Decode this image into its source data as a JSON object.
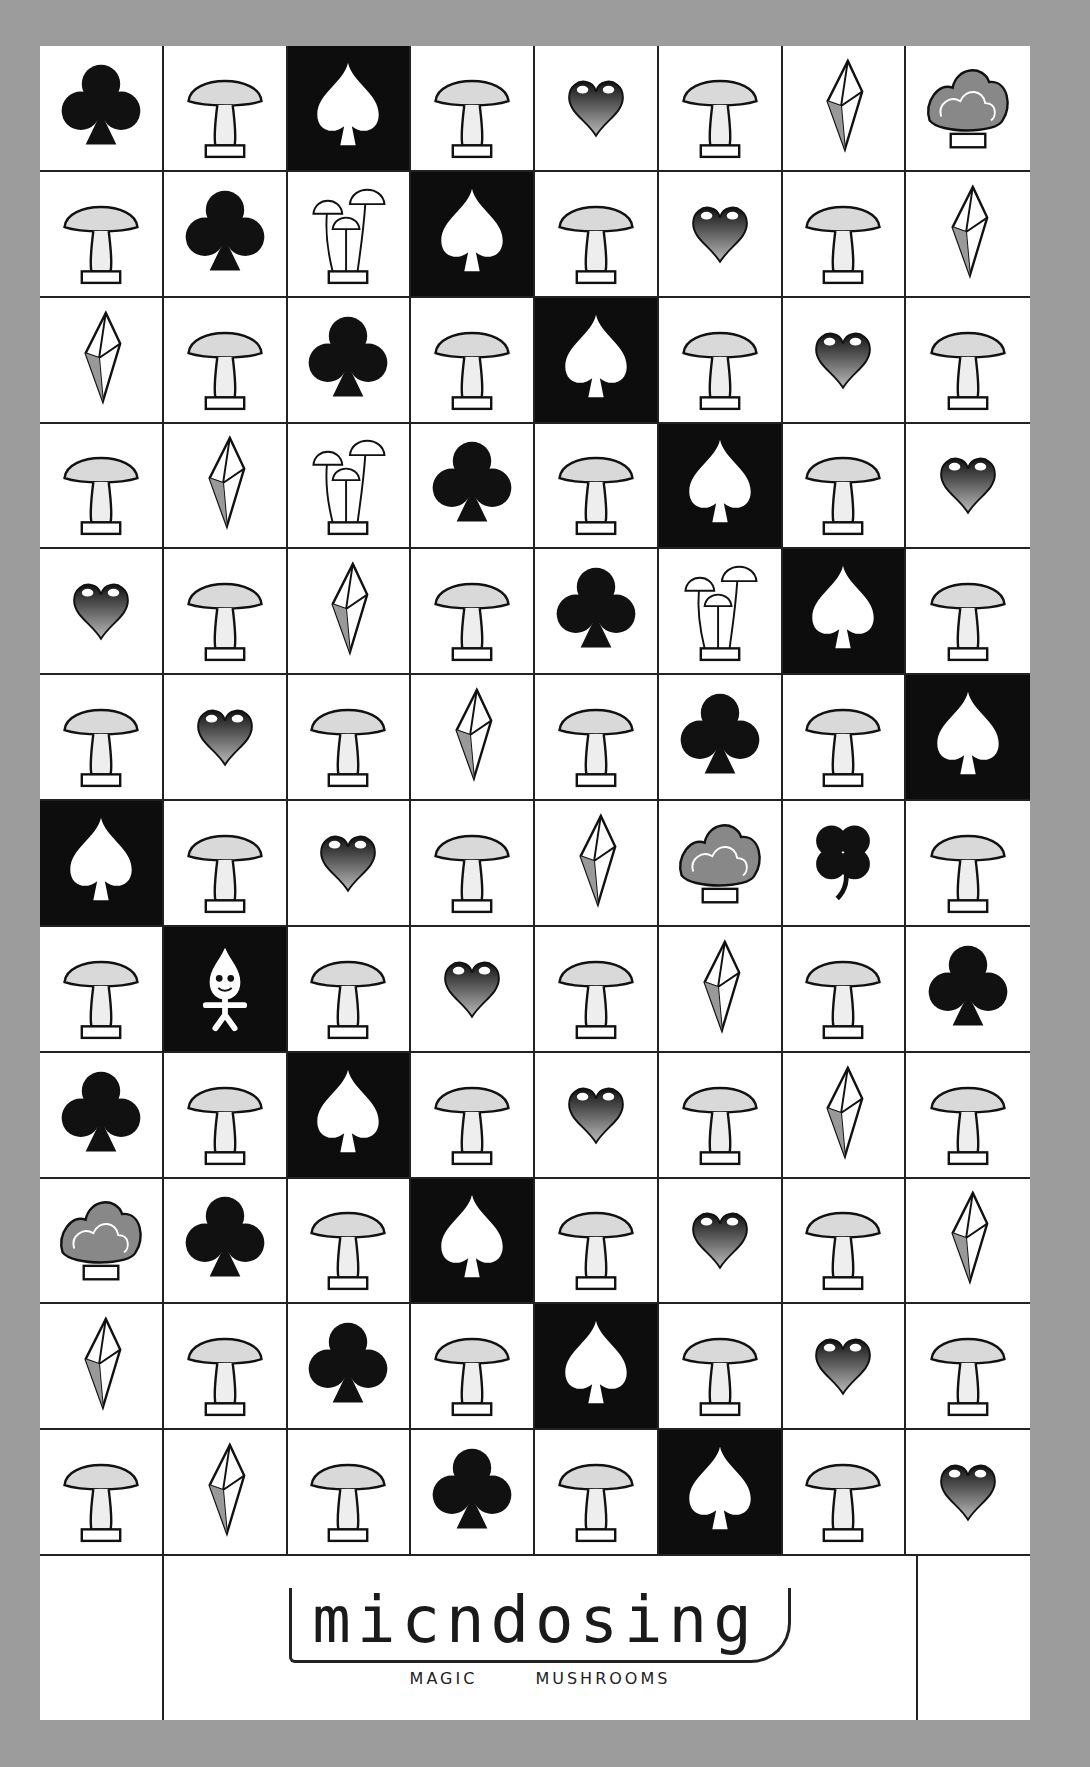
{
  "artwork": {
    "title": "micndosing",
    "subtitle": "MAGIC MUSHROOMS",
    "colors": {
      "background": "#9c9c9c",
      "paper": "#ffffff",
      "ink": "#111111",
      "shade": "#d9d9d9"
    },
    "grid": {
      "columns": 8,
      "rows": [
        [
          "club",
          "mushroom",
          "spade",
          "mushroom",
          "heart",
          "mushroom",
          "crystal",
          "coral"
        ],
        [
          "mushroom",
          "club",
          "mushroom-cluster",
          "spade",
          "mushroom",
          "heart",
          "mushroom",
          "crystal"
        ],
        [
          "crystal",
          "mushroom",
          "club",
          "mushroom",
          "spade",
          "mushroom",
          "heart",
          "mushroom"
        ],
        [
          "mushroom",
          "crystal",
          "mushroom-cluster",
          "club",
          "mushroom",
          "spade",
          "mushroom",
          "heart"
        ],
        [
          "heart",
          "mushroom",
          "crystal",
          "mushroom",
          "club",
          "mushroom-cluster",
          "spade",
          "mushroom"
        ],
        [
          "mushroom",
          "heart",
          "mushroom",
          "crystal",
          "mushroom",
          "club",
          "mushroom",
          "spade"
        ],
        [
          "spade",
          "mushroom",
          "heart",
          "mushroom",
          "crystal",
          "coral",
          "clover",
          "mushroom"
        ],
        [
          "mushroom",
          "doll",
          "mushroom",
          "heart",
          "mushroom",
          "crystal",
          "mushroom",
          "club"
        ],
        [
          "club",
          "mushroom",
          "spade",
          "mushroom",
          "heart",
          "mushroom",
          "crystal",
          "mushroom"
        ],
        [
          "coral",
          "club",
          "mushroom",
          "spade",
          "mushroom",
          "heart",
          "mushroom",
          "crystal"
        ],
        [
          "crystal",
          "mushroom",
          "club",
          "mushroom",
          "spade",
          "mushroom",
          "heart",
          "mushroom"
        ],
        [
          "mushroom",
          "crystal",
          "mushroom",
          "club",
          "mushroom",
          "spade",
          "mushroom",
          "heart"
        ]
      ]
    },
    "footer": {
      "left_icon": "heart",
      "right_icon": "mushroom"
    }
  }
}
